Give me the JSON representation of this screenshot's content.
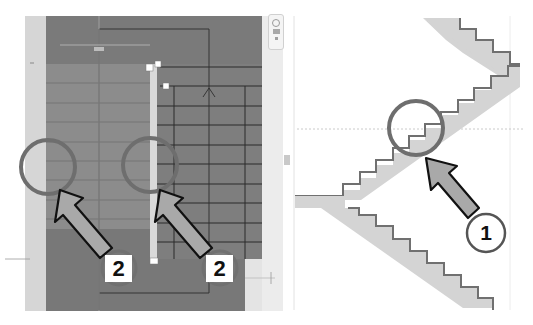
{
  "figure": {
    "left_panel": {
      "name": "stair-plan-view",
      "view_control_icons": [
        "zoom-icon",
        "pan-icon",
        "navigate-icon"
      ],
      "run_labels": [
        "1",
        "2",
        "15"
      ],
      "callouts": [
        {
          "label": "2",
          "target": "left-run-boundary-edge"
        },
        {
          "label": "2",
          "target": "right-run-boundary-edge"
        }
      ]
    },
    "right_panel": {
      "name": "stair-section-view",
      "callouts": [
        {
          "label": "1",
          "target": "stair-riser-step"
        }
      ]
    },
    "colors": {
      "plan_dark": "#7d7d7d",
      "plan_mid": "#8e8e8e",
      "plan_light_strip": "#d8d8d8",
      "stair_fill": "#d2d2d2",
      "stair_outline": "#707070",
      "callout_ring": "#6e6e6e",
      "arrow_fill": "#a9a9a9"
    }
  }
}
